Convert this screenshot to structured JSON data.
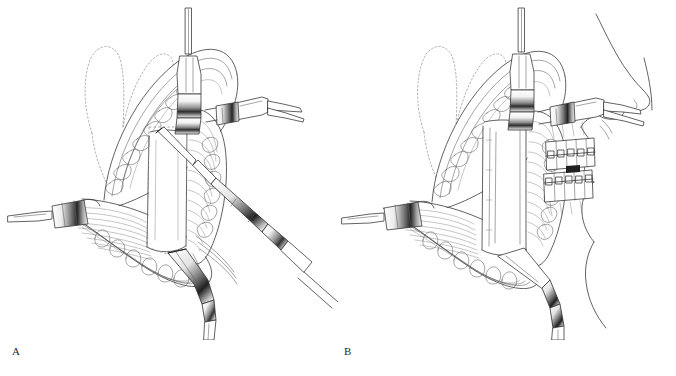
{
  "figure": {
    "type": "medical-surgical-illustration",
    "background_color": "#ffffff",
    "line_color": "#3a3a3a",
    "width": 676,
    "height": 376
  },
  "panels": [
    {
      "id": "a",
      "label": "A",
      "caption": "",
      "description": "Intraoral exposure of the mandibular ramus with retractors in place and a reciprocating saw / bur handpiece performing the vertical osteotomy cut along the dashed outline.",
      "features": [
        "superior retractor",
        "right angled retractor",
        "left retractor",
        "inferior curved retractor",
        "saw handpiece",
        "dashed osteotomy outline",
        "dotted coronoid contour",
        "muscle striations",
        "lobulated soft tissue"
      ]
    },
    {
      "id": "b",
      "label": "B",
      "caption": "",
      "description": "Same exposure after completion of the osteotomy, with the facial profile and dentition bearing orthodontic brackets shown at the right.",
      "features": [
        "superior retractor",
        "right angled retractor",
        "left retractor",
        "inferior curved retractor",
        "completed vertical osteotomy",
        "facial profile",
        "upper dental arch with brackets",
        "lower dental arch with brackets",
        "dotted coronoid contour"
      ]
    }
  ],
  "annotations": {
    "dentition": {
      "upper_arch_teeth": 5,
      "lower_arch_teeth": 5,
      "appliance": "orthodontic brackets with archwire"
    }
  }
}
